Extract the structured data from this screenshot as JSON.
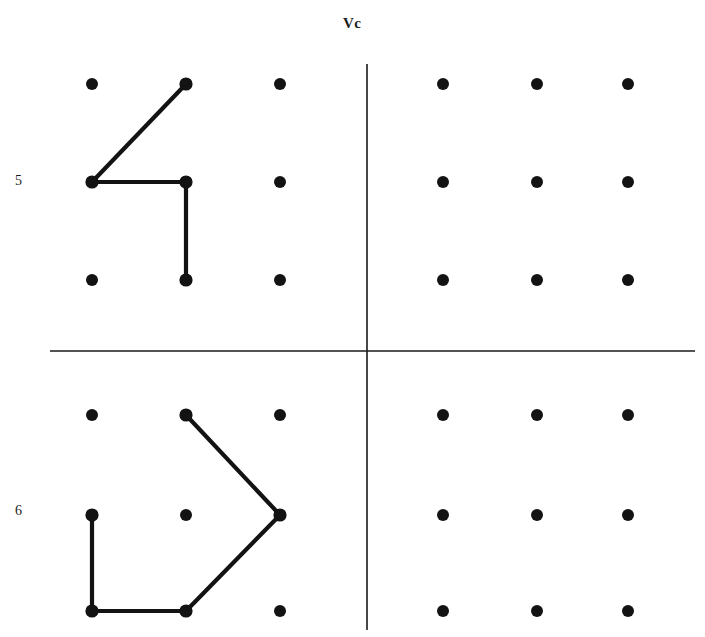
{
  "figure": {
    "title_label": "Vc",
    "row_labels": [
      "5",
      "6"
    ],
    "caption_fragment": "",
    "background_color": "#ffffff",
    "ink_color": "#131313",
    "axis_color": "#1a1a1a"
  },
  "axes": {
    "vertical": {
      "x": 367,
      "y1": 64,
      "y2": 630
    },
    "horizontal": {
      "y": 351,
      "x1": 50,
      "x2": 695
    }
  },
  "labels": {
    "vc": "Vc",
    "row_top": "5",
    "row_bottom": "6"
  },
  "chart_data": {
    "type": "scatter",
    "title": "Vc",
    "xlabel": "",
    "ylabel": "",
    "grid": false,
    "legend_position": "none",
    "dot_radius": 6,
    "quadrants": [
      {
        "name": "top-left",
        "row_label": "5",
        "columns_x": [
          92,
          186,
          280
        ],
        "rows_y": [
          84,
          182,
          280
        ],
        "dots": [
          [
            92,
            84
          ],
          [
            186,
            84
          ],
          [
            280,
            84
          ],
          [
            92,
            182
          ],
          [
            186,
            182
          ],
          [
            280,
            182
          ],
          [
            92,
            280
          ],
          [
            186,
            280
          ],
          [
            280,
            280
          ]
        ],
        "path": {
          "name": "pattern-5",
          "closed": false,
          "points": [
            [
              186,
              84
            ],
            [
              92,
              182
            ],
            [
              186,
              182
            ],
            [
              186,
              280
            ]
          ],
          "grid_indices": [
            [
              0,
              1
            ],
            [
              1,
              0
            ],
            [
              1,
              1
            ],
            [
              2,
              1
            ]
          ]
        }
      },
      {
        "name": "top-right",
        "row_label": "5",
        "columns_x": [
          443,
          537,
          628
        ],
        "rows_y": [
          84,
          182,
          280
        ],
        "dots": [
          [
            443,
            84
          ],
          [
            537,
            84
          ],
          [
            628,
            84
          ],
          [
            443,
            182
          ],
          [
            537,
            182
          ],
          [
            628,
            182
          ],
          [
            443,
            280
          ],
          [
            537,
            280
          ],
          [
            628,
            280
          ]
        ],
        "path": null
      },
      {
        "name": "bottom-left",
        "row_label": "6",
        "columns_x": [
          92,
          186,
          280
        ],
        "rows_y": [
          415,
          515,
          611
        ],
        "dots": [
          [
            92,
            415
          ],
          [
            186,
            415
          ],
          [
            280,
            415
          ],
          [
            92,
            515
          ],
          [
            186,
            515
          ],
          [
            280,
            515
          ],
          [
            92,
            611
          ],
          [
            186,
            611
          ],
          [
            280,
            611
          ]
        ],
        "path": {
          "name": "pattern-6",
          "closed": false,
          "points": [
            [
              92,
              515
            ],
            [
              92,
              611
            ],
            [
              186,
              611
            ],
            [
              280,
              515
            ],
            [
              186,
              415
            ]
          ],
          "grid_indices": [
            [
              1,
              0
            ],
            [
              2,
              0
            ],
            [
              2,
              1
            ],
            [
              1,
              2
            ],
            [
              0,
              1
            ]
          ]
        }
      },
      {
        "name": "bottom-right",
        "row_label": "6",
        "columns_x": [
          443,
          537,
          628
        ],
        "rows_y": [
          415,
          515,
          611
        ],
        "dots": [
          [
            443,
            415
          ],
          [
            537,
            415
          ],
          [
            628,
            415
          ],
          [
            443,
            515
          ],
          [
            537,
            515
          ],
          [
            628,
            515
          ],
          [
            443,
            611
          ],
          [
            537,
            611
          ],
          [
            628,
            611
          ]
        ],
        "path": null
      }
    ]
  }
}
